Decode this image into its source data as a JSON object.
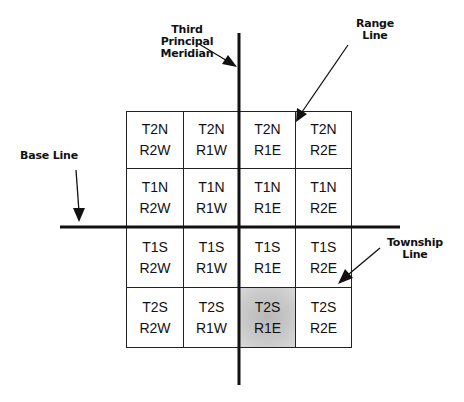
{
  "labels": {
    "meridian": "Third Principal Meridian",
    "meridian_lines": [
      "Third",
      "Principal",
      "Meridian"
    ],
    "range_line": [
      "Range",
      "Line"
    ],
    "base_line": "Base Line",
    "township_line": [
      "Township",
      "Line"
    ]
  },
  "grid": {
    "rows": [
      [
        {
          "t": "T2N",
          "r": "R2W"
        },
        {
          "t": "T2N",
          "r": "R1W"
        },
        {
          "t": "T2N",
          "r": "R1E"
        },
        {
          "t": "T2N",
          "r": "R2E"
        }
      ],
      [
        {
          "t": "T1N",
          "r": "R2W"
        },
        {
          "t": "T1N",
          "r": "R1W"
        },
        {
          "t": "T1N",
          "r": "R1E"
        },
        {
          "t": "T1N",
          "r": "R2E"
        }
      ],
      [
        {
          "t": "T1S",
          "r": "R2W"
        },
        {
          "t": "T1S",
          "r": "R1W"
        },
        {
          "t": "T1S",
          "r": "R1E"
        },
        {
          "t": "T1S",
          "r": "R2E"
        }
      ],
      [
        {
          "t": "T2S",
          "r": "R2W"
        },
        {
          "t": "T2S",
          "r": "R1W"
        },
        {
          "t": "T2S",
          "r": "R1E"
        },
        {
          "t": "T2S",
          "r": "R2E"
        }
      ]
    ],
    "highlighted": {
      "row": 3,
      "col": 2,
      "label": "T2S R1E"
    }
  },
  "colors": {
    "line": "#111111",
    "cell_border": "#222222",
    "highlight": "#c4c4c4"
  }
}
